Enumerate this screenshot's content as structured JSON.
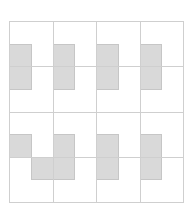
{
  "diagram": {
    "type": "grid-pattern",
    "grid": {
      "columns": 4,
      "rows": 4,
      "subdivisions_per_cell": 2,
      "origin_px": [
        9,
        21
      ],
      "size_px": [
        174,
        181
      ],
      "line_color": "#cfcfcf"
    },
    "fill_color": "#d9d9d9",
    "fill_border_color": "#c6c6c6",
    "filled_subcells": [
      {
        "col": 0,
        "row": 1
      },
      {
        "col": 0,
        "row": 2
      },
      {
        "col": 2,
        "row": 1
      },
      {
        "col": 2,
        "row": 2
      },
      {
        "col": 4,
        "row": 1
      },
      {
        "col": 4,
        "row": 2
      },
      {
        "col": 6,
        "row": 1
      },
      {
        "col": 6,
        "row": 2
      },
      {
        "col": 0,
        "row": 5
      },
      {
        "col": 1,
        "row": 6
      },
      {
        "col": 2,
        "row": 5
      },
      {
        "col": 2,
        "row": 6
      },
      {
        "col": 4,
        "row": 5
      },
      {
        "col": 4,
        "row": 6
      },
      {
        "col": 6,
        "row": 5
      },
      {
        "col": 6,
        "row": 6
      }
    ]
  }
}
